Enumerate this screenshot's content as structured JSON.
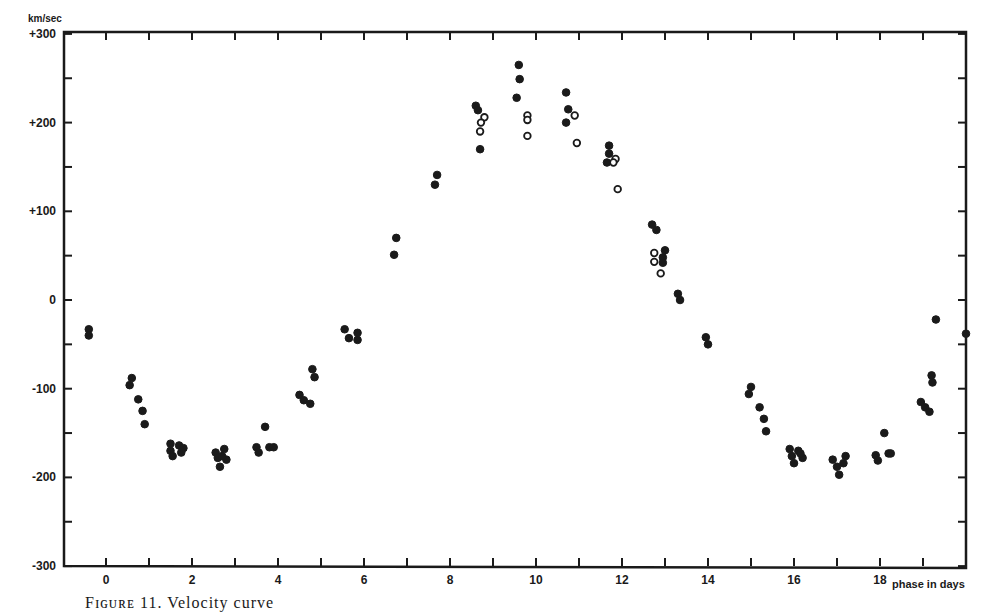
{
  "chart_data": {
    "type": "scatter",
    "title": "",
    "xlabel": "phase in days",
    "ylabel": "km/sec",
    "xlim": [
      -1,
      20
    ],
    "ylim": [
      -300,
      300
    ],
    "grid": false,
    "x_ticks": [
      0,
      1,
      2,
      3,
      4,
      5,
      6,
      7,
      8,
      9,
      10,
      11,
      12,
      13,
      14,
      15,
      16,
      17,
      18,
      19
    ],
    "x_tick_labels": [
      {
        "value": 0,
        "label": "0"
      },
      {
        "value": 2,
        "label": "2"
      },
      {
        "value": 4,
        "label": "4"
      },
      {
        "value": 6,
        "label": "6"
      },
      {
        "value": 8,
        "label": "8"
      },
      {
        "value": 10,
        "label": "10"
      },
      {
        "value": 12,
        "label": "12"
      },
      {
        "value": 14,
        "label": "14"
      },
      {
        "value": 16,
        "label": "16"
      },
      {
        "value": 18,
        "label": "18"
      }
    ],
    "y_ticks": [
      -300,
      -250,
      -200,
      -150,
      -100,
      -50,
      0,
      50,
      100,
      150,
      200,
      250,
      300
    ],
    "y_tick_labels": [
      {
        "value": 300,
        "label": "+300"
      },
      {
        "value": 200,
        "label": "+200"
      },
      {
        "value": 100,
        "label": "+100"
      },
      {
        "value": 0,
        "label": "0"
      },
      {
        "value": -100,
        "label": "-100"
      },
      {
        "value": -200,
        "label": "-200"
      },
      {
        "value": -300,
        "label": "-300"
      }
    ],
    "series": [
      {
        "name": "filled circles",
        "marker": "filled",
        "points": [
          [
            -0.4,
            -33
          ],
          [
            -0.4,
            -40
          ],
          [
            0.55,
            -96
          ],
          [
            0.6,
            -88
          ],
          [
            0.75,
            -112
          ],
          [
            0.85,
            -125
          ],
          [
            0.9,
            -140
          ],
          [
            1.5,
            -162
          ],
          [
            1.5,
            -170
          ],
          [
            1.55,
            -176
          ],
          [
            1.7,
            -164
          ],
          [
            1.75,
            -172
          ],
          [
            1.8,
            -167
          ],
          [
            2.55,
            -172
          ],
          [
            2.6,
            -178
          ],
          [
            2.65,
            -188
          ],
          [
            2.75,
            -168
          ],
          [
            2.8,
            -180
          ],
          [
            2.7,
            -176
          ],
          [
            3.5,
            -166
          ],
          [
            3.55,
            -172
          ],
          [
            3.7,
            -143
          ],
          [
            3.8,
            -166
          ],
          [
            3.9,
            -166
          ],
          [
            4.5,
            -107
          ],
          [
            4.6,
            -113
          ],
          [
            4.75,
            -117
          ],
          [
            4.8,
            -78
          ],
          [
            4.85,
            -87
          ],
          [
            5.55,
            -33
          ],
          [
            5.65,
            -43
          ],
          [
            5.85,
            -37
          ],
          [
            5.85,
            -45
          ],
          [
            6.7,
            51
          ],
          [
            6.75,
            70
          ],
          [
            7.65,
            130
          ],
          [
            7.7,
            141
          ],
          [
            8.6,
            219
          ],
          [
            8.65,
            214
          ],
          [
            8.7,
            170
          ],
          [
            9.6,
            265
          ],
          [
            9.62,
            249
          ],
          [
            9.55,
            228
          ],
          [
            10.7,
            234
          ],
          [
            10.75,
            215
          ],
          [
            10.7,
            200
          ],
          [
            11.7,
            174
          ],
          [
            11.7,
            165
          ],
          [
            11.65,
            155
          ],
          [
            12.7,
            85
          ],
          [
            12.8,
            79
          ],
          [
            13.0,
            56
          ],
          [
            12.95,
            48
          ],
          [
            12.95,
            42
          ],
          [
            13.3,
            7
          ],
          [
            13.35,
            0
          ],
          [
            13.95,
            -42
          ],
          [
            14.0,
            -50
          ],
          [
            14.95,
            -106
          ],
          [
            15.0,
            -98
          ],
          [
            15.2,
            -121
          ],
          [
            15.3,
            -134
          ],
          [
            15.35,
            -148
          ],
          [
            15.9,
            -168
          ],
          [
            15.95,
            -176
          ],
          [
            16.0,
            -184
          ],
          [
            16.1,
            -170
          ],
          [
            16.2,
            -178
          ],
          [
            16.15,
            -173
          ],
          [
            16.9,
            -180
          ],
          [
            17.0,
            -188
          ],
          [
            17.05,
            -197
          ],
          [
            17.15,
            -184
          ],
          [
            17.2,
            -176
          ],
          [
            17.9,
            -175
          ],
          [
            17.95,
            -181
          ],
          [
            18.2,
            -173
          ],
          [
            18.1,
            -150
          ],
          [
            18.25,
            -173
          ],
          [
            18.95,
            -115
          ],
          [
            19.05,
            -121
          ],
          [
            19.15,
            -126
          ],
          [
            19.2,
            -85
          ],
          [
            19.22,
            -93
          ],
          [
            19.3,
            -22
          ],
          [
            20.0,
            -38
          ]
        ]
      },
      {
        "name": "open circles",
        "marker": "open",
        "points": [
          [
            8.8,
            206
          ],
          [
            8.72,
            200
          ],
          [
            8.7,
            190
          ],
          [
            9.8,
            208
          ],
          [
            9.8,
            203
          ],
          [
            9.8,
            185
          ],
          [
            10.9,
            208
          ],
          [
            10.95,
            177
          ],
          [
            11.85,
            159
          ],
          [
            11.8,
            155
          ],
          [
            11.9,
            125
          ],
          [
            12.75,
            53
          ],
          [
            12.75,
            43
          ],
          [
            12.9,
            30
          ]
        ]
      }
    ],
    "legend": null,
    "annotations": [],
    "caption_fragment": "Figure 11 ... Velocity curve"
  },
  "axes": {
    "y_unit": "km/sec",
    "x_label": "phase in days"
  },
  "caption": {
    "text": "Fɪɢᴜʀᴇ 11.  Velocity curve"
  }
}
